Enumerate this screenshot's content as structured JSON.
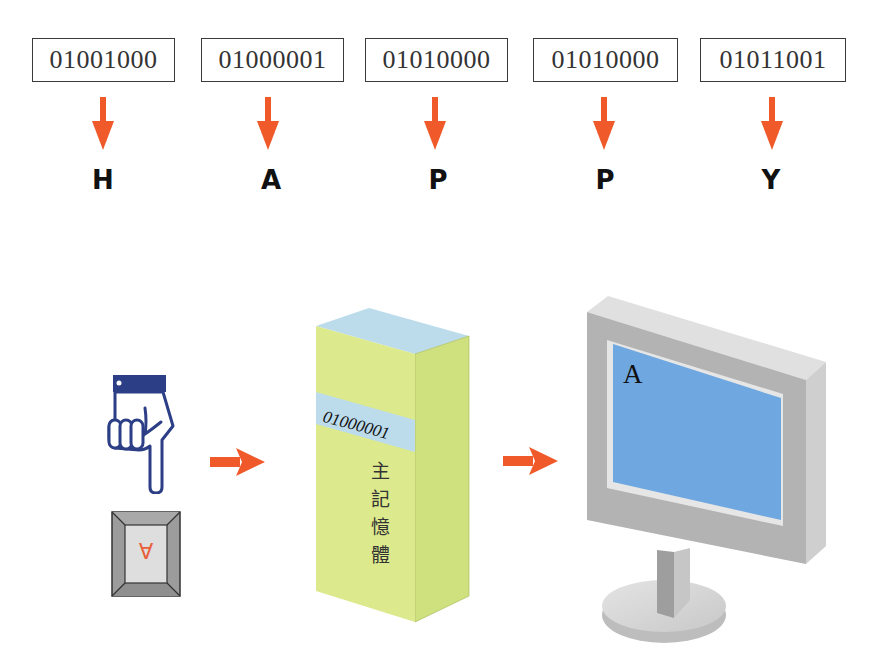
{
  "colors": {
    "arrow": "#f05a2a",
    "box_border": "#3a3a3a",
    "memory_front": "#d9e88a",
    "memory_side": "#cfe07e",
    "memory_band": "#bcdcec",
    "screen": "#6fa8e0",
    "bezel": "#b8b8b8",
    "hand_blue": "#2c3e85"
  },
  "encoding": [
    {
      "binary": "01001000",
      "char": "H"
    },
    {
      "binary": "01000001",
      "char": "A"
    },
    {
      "binary": "01010000",
      "char": "P"
    },
    {
      "binary": "01010000",
      "char": "P"
    },
    {
      "binary": "01011001",
      "char": "Y"
    }
  ],
  "flow": {
    "input": {
      "icon": "pointing-hand-icon",
      "key_label": "A"
    },
    "memory": {
      "stored_code": "01000001",
      "label_chars": [
        "主",
        "記",
        "憶",
        "體"
      ]
    },
    "output": {
      "screen_char": "A"
    }
  }
}
